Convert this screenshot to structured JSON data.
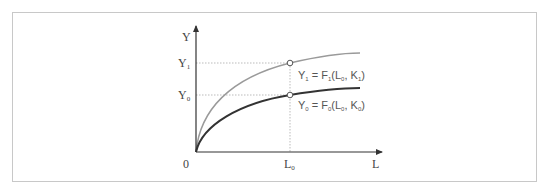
{
  "diagram": {
    "type": "production-function-shift",
    "axes": {
      "y_label": "Y",
      "x_label": "L",
      "origin_label": "0"
    },
    "y_ticks": [
      {
        "base": "Y",
        "sub": "1"
      },
      {
        "base": "Y",
        "sub": "0"
      }
    ],
    "x_ticks": [
      {
        "base": "L",
        "sub": "0"
      }
    ],
    "curves": [
      {
        "name": "upper-curve",
        "label_parts": {
          "y": "Y",
          "y_sub": "1",
          "eq": " = ",
          "f": "F",
          "f_sub": "1",
          "open": "(L",
          "l_sub": "0",
          "comma": ",  K",
          "k_sub": "1",
          "close": ")"
        },
        "color": "#9a9a9a"
      },
      {
        "name": "lower-curve",
        "label_parts": {
          "y": "Y",
          "y_sub": "0",
          "eq": " = ",
          "f": "F",
          "f_sub": "0",
          "open": "(L",
          "l_sub": "0",
          "comma": ",  K",
          "k_sub": "0",
          "close": ")"
        },
        "color": "#333333"
      }
    ],
    "colors": {
      "frame": "#c8c8c8",
      "axis": "#333333",
      "guide": "#aaaaaa",
      "upper_curve": "#9a9a9a",
      "lower_curve": "#333333"
    }
  }
}
